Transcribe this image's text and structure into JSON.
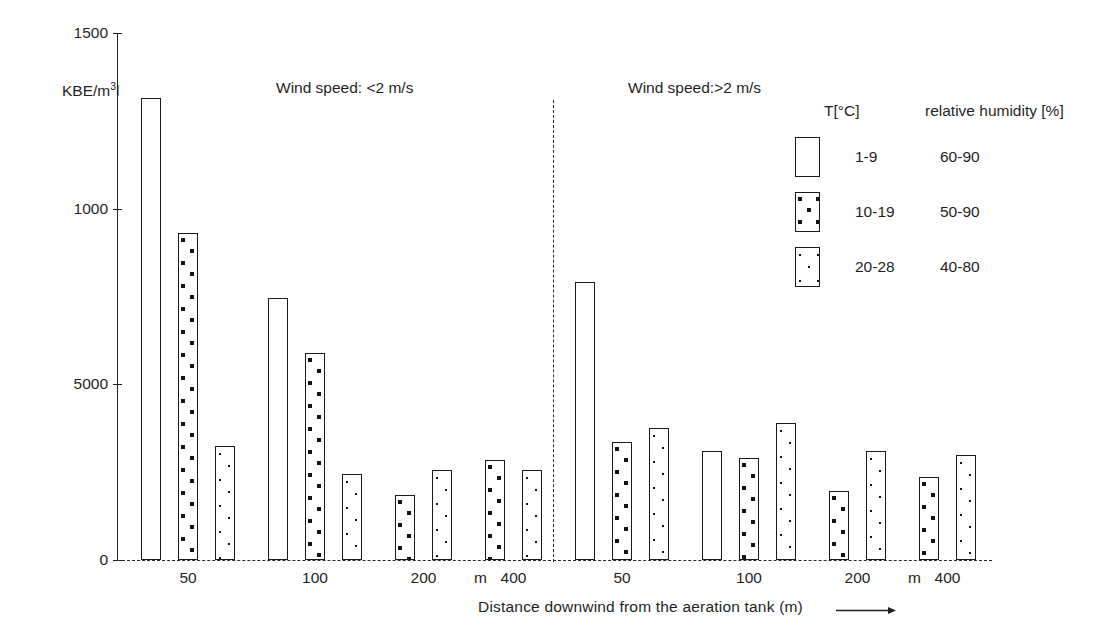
{
  "chart_data": {
    "type": "bar",
    "title": "",
    "xlabel": "Distance downwind from the aeration tank (m)",
    "ylabel": "KBE/m3",
    "ylim": [
      0,
      1500
    ],
    "yticks": [
      0,
      500,
      1000,
      1500
    ],
    "ytick_labels": [
      "0",
      "5000",
      "1000",
      "1500"
    ],
    "grid": false,
    "legend_position": "top-right",
    "categories": [
      "50",
      "100",
      "200",
      "400"
    ],
    "unit_marker": "m",
    "panels": [
      {
        "name": "wind-speed-low",
        "label": "Wind speed: <2 m/s",
        "groups": [
          {
            "category": "50",
            "bars": [
              {
                "series": "1-9",
                "pattern": "empty",
                "value": 1315
              },
              {
                "series": "10-19",
                "pattern": "bigdots",
                "value": 930
              },
              {
                "series": "20-28",
                "pattern": "smalldots",
                "value": 325
              }
            ]
          },
          {
            "category": "100",
            "bars": [
              {
                "series": "1-9",
                "pattern": "empty",
                "value": 745
              },
              {
                "series": "10-19",
                "pattern": "bigdots",
                "value": 590
              },
              {
                "series": "20-28",
                "pattern": "smalldots",
                "value": 245
              }
            ]
          },
          {
            "category": "200",
            "bars": [
              {
                "series": "10-19",
                "pattern": "bigdots",
                "value": 185
              },
              {
                "series": "20-28",
                "pattern": "smalldots",
                "value": 255
              }
            ]
          },
          {
            "category": "400",
            "bars": [
              {
                "series": "10-19",
                "pattern": "bigdots",
                "value": 285
              },
              {
                "series": "20-28",
                "pattern": "smalldots",
                "value": 255
              }
            ]
          }
        ]
      },
      {
        "name": "wind-speed-high",
        "label": "Wind speed:>2 m/s",
        "groups": [
          {
            "category": "50",
            "bars": [
              {
                "series": "1-9",
                "pattern": "empty",
                "value": 790
              },
              {
                "series": "10-19",
                "pattern": "bigdots",
                "value": 335
              },
              {
                "series": "20-28",
                "pattern": "smalldots",
                "value": 375
              }
            ]
          },
          {
            "category": "100",
            "bars": [
              {
                "series": "1-9",
                "pattern": "empty",
                "value": 310
              },
              {
                "series": "10-19",
                "pattern": "bigdots",
                "value": 290
              },
              {
                "series": "20-28",
                "pattern": "smalldots",
                "value": 390
              }
            ]
          },
          {
            "category": "200",
            "bars": [
              {
                "series": "10-19",
                "pattern": "bigdots",
                "value": 195
              },
              {
                "series": "20-28",
                "pattern": "smalldots",
                "value": 310
              }
            ]
          },
          {
            "category": "400",
            "bars": [
              {
                "series": "10-19",
                "pattern": "bigdots",
                "value": 235
              },
              {
                "series": "20-28",
                "pattern": "smalldots",
                "value": 300
              }
            ]
          }
        ]
      }
    ],
    "legend": {
      "col1_header": "T[°C]",
      "col2_header": "relative humidity [%]",
      "entries": [
        {
          "pattern": "empty",
          "temperature": "1-9",
          "humidity": "60-90"
        },
        {
          "pattern": "bigdots",
          "temperature": "10-19",
          "humidity": "50-90"
        },
        {
          "pattern": "smalldots",
          "temperature": "20-28",
          "humidity": "40-80"
        }
      ]
    }
  },
  "axis": {
    "y_title_main": "KBE/m",
    "y_title_sup": "3",
    "y_title_tail": "l"
  }
}
